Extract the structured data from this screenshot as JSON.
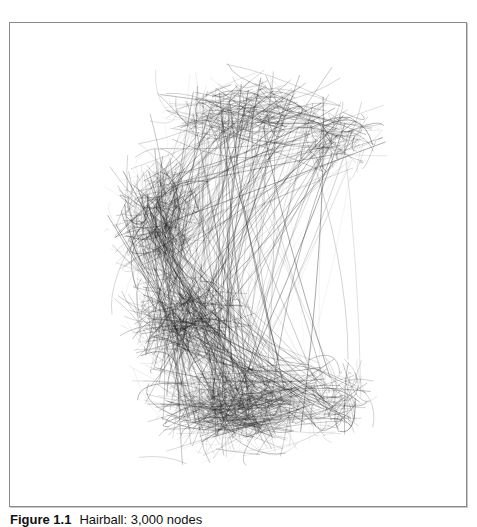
{
  "figure": {
    "caption_label": "Figure 1.1",
    "caption_text": "Hairball: 3,000 nodes",
    "border_color": "#8a8a8a",
    "background": "#ffffff"
  },
  "hairball": {
    "stroke_color": "#1a1a1a",
    "edge_count": 1400,
    "seed": 7,
    "regions": [
      {
        "cx": 235,
        "cy": 90,
        "rx": 120,
        "ry": 55,
        "weight": 0.16
      },
      {
        "cx": 150,
        "cy": 200,
        "rx": 70,
        "ry": 90,
        "weight": 0.22
      },
      {
        "cx": 175,
        "cy": 300,
        "rx": 80,
        "ry": 70,
        "weight": 0.2
      },
      {
        "cx": 230,
        "cy": 385,
        "rx": 125,
        "ry": 65,
        "weight": 0.3
      },
      {
        "cx": 330,
        "cy": 115,
        "rx": 60,
        "ry": 50,
        "weight": 0.07
      },
      {
        "cx": 330,
        "cy": 380,
        "rx": 55,
        "ry": 55,
        "weight": 0.05
      }
    ]
  }
}
